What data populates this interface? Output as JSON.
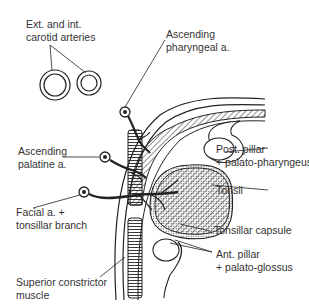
{
  "diagram": {
    "colors": {
      "ink": "#222222",
      "background": "#ffffff"
    },
    "labels": {
      "carotid": {
        "line1": "Ext. and int.",
        "line2": "carotid arteries"
      },
      "asc_pharyngeal": {
        "line1": "Ascending",
        "line2": "pharyngeal a."
      },
      "post_pillar": {
        "line1": "Post. pillar",
        "line2": "+ palato-pharyngeus"
      },
      "asc_palatine": {
        "line1": "Ascending",
        "line2": "palatine a."
      },
      "tonsil": {
        "line1": "Tonsil"
      },
      "facial": {
        "line1": "Facial a. +",
        "line2": "tonsillar branch"
      },
      "capsule": {
        "line1": "Tonsillar capsule"
      },
      "ant_pillar": {
        "line1": "Ant. pillar",
        "line2": "+ palato-glossus"
      },
      "sup_constrictor": {
        "line1": "Superior constrictor",
        "line2": "muscle"
      }
    }
  }
}
